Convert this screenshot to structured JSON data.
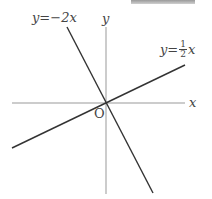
{
  "diagram": {
    "type": "coordinate-plane",
    "axes": {
      "x_label": "x",
      "y_label": "y",
      "origin_label": "O"
    },
    "lines": [
      {
        "label": "y=−2x",
        "slope": -2
      },
      {
        "label_prefix": "y=",
        "label_num": "1",
        "label_den": "2",
        "label_suffix": "x",
        "slope": 0.5
      }
    ],
    "colors": {
      "axis": "#888888",
      "line": "#333333",
      "text": "#444444"
    }
  }
}
